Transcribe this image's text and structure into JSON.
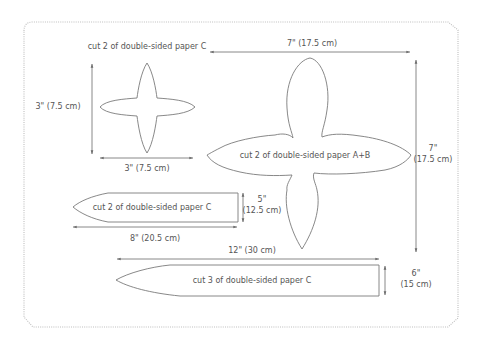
{
  "diagram": {
    "pieces": [
      {
        "id": "small-star",
        "shape": "four-pointed star",
        "label": "cut 2 of double-sided paper C",
        "height_label": "3\" (7.5 cm)",
        "width_label": "3\" (7.5 cm)"
      },
      {
        "id": "large-flower",
        "shape": "four-petal flower",
        "label": "cut 2 of double-sided paper A+B",
        "width_label": "7\" (17.5 cm)",
        "height_label_line1": "7\"",
        "height_label_line2": "(17.5 cm)"
      },
      {
        "id": "short-strip",
        "shape": "pointed strip",
        "label": "cut 2 of double-sided paper C",
        "width_label": "8\" (20.5 cm)",
        "height_label_line1": "5\"",
        "height_label_line2": "(12.5 cm)"
      },
      {
        "id": "long-strip",
        "shape": "pointed strip",
        "label": "cut 3 of double-sided paper C",
        "width_label": "12\" (30 cm)",
        "height_label_line1": "6\"",
        "height_label_line2": "(15 cm)"
      }
    ],
    "colors": {
      "outline": "#7a7a7a",
      "text": "#555555",
      "border": "#bdbdbd",
      "background": "#ffffff"
    }
  }
}
